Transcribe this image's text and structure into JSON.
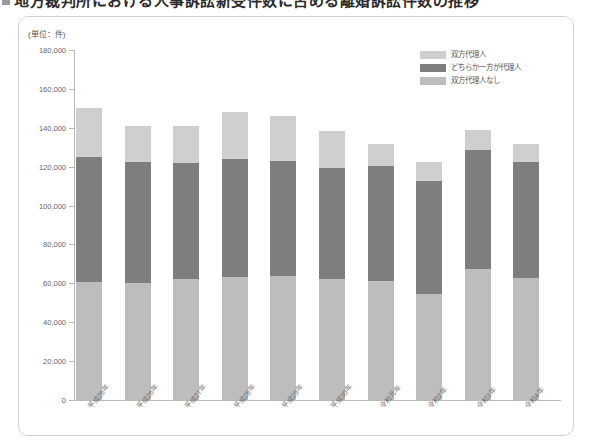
{
  "heading": {
    "bullet_icon": "square-bullet-icon",
    "title": "地方裁判所における人事訴訟新受件数に占める離婚訴訟件数の推移"
  },
  "unit_note": "(単位：件)",
  "legend": {
    "position": "top-right",
    "items": [
      {
        "label": "双方代理人",
        "color": "#cfcfcf",
        "key": "both"
      },
      {
        "label": "どちらか一方が代理人",
        "color": "#7e7e7e",
        "key": "one"
      },
      {
        "label": "双方代理人なし",
        "color": "#bdbdbd",
        "key": "none"
      }
    ]
  },
  "chart_data": {
    "type": "bar",
    "stacked": true,
    "title": "地方裁判所における人事訴訟新受件数に占める離婚訴訟件数の推移",
    "xlabel": "",
    "ylabel": "(単位：件)",
    "ylim": [
      0,
      180000
    ],
    "ytick_step": 20000,
    "yticks": [
      0,
      20000,
      40000,
      60000,
      80000,
      100000,
      120000,
      140000,
      160000,
      180000
    ],
    "ytick_labels": [
      "0",
      "20,000",
      "40,000",
      "60,000",
      "80,000",
      "100,000",
      "120,000",
      "140,000",
      "160,000",
      "180,000"
    ],
    "grid": false,
    "categories": [
      "平成25年",
      "平成26年",
      "平成27年",
      "平成28年",
      "平成29年",
      "平成30年",
      "令和元年",
      "令和2年",
      "令和3年",
      "令和4年"
    ],
    "series": [
      {
        "name": "双方代理人なし",
        "key": "none",
        "color": "#bdbdbd",
        "values": [
          60500,
          60000,
          62000,
          63500,
          64000,
          62000,
          61000,
          54500,
          67500,
          62500
        ]
      },
      {
        "name": "どちらか一方が代理人",
        "key": "one",
        "color": "#7e7e7e",
        "values": [
          64500,
          62500,
          60000,
          60500,
          59000,
          57500,
          59500,
          58000,
          61000,
          60000
        ]
      },
      {
        "name": "双方代理人",
        "key": "both",
        "color": "#cfcfcf",
        "values": [
          25000,
          18500,
          19000,
          24000,
          23000,
          19000,
          11000,
          10000,
          10500,
          9000
        ]
      }
    ],
    "totals": [
      150000,
      141000,
      141000,
      148000,
      146000,
      138500,
      131500,
      122500,
      139000,
      131500
    ]
  }
}
